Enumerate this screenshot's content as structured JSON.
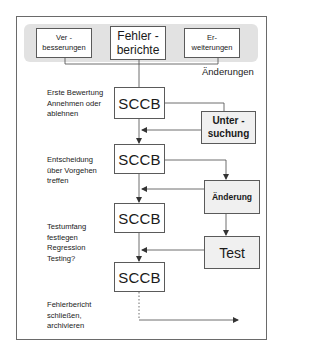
{
  "diagram": {
    "source_row": {
      "items": [
        {
          "line1": "Ver -",
          "line2": "besserungen"
        },
        {
          "line1": "Fehler -",
          "line2": "berichte"
        },
        {
          "line1": "Er-",
          "line2": "weiterungen"
        }
      ],
      "group_label": "Änderungen"
    },
    "steps": [
      {
        "node": "SCCB",
        "description": [
          "Erste Bewertung",
          "Annehmen oder",
          "ablehnen"
        ]
      },
      {
        "node": "SCCB",
        "description": [
          "Entscheidung",
          "über Vorgehen",
          "treffen"
        ]
      },
      {
        "node": "SCCB",
        "description": [
          "Testumfang",
          "festlegen",
          "Regression",
          "Testing?"
        ]
      },
      {
        "node": "SCCB",
        "description": [
          "Fehlerbericht",
          "schließen,",
          "archivieren"
        ]
      }
    ],
    "side_nodes": [
      {
        "line1": "Unter -",
        "line2": "suchung"
      },
      {
        "label": "Änderung"
      },
      {
        "label": "Test"
      }
    ],
    "colors": {
      "band": "#e2e2e2",
      "box_border": "#5a5a5a",
      "gray_box": "#f0f0f0",
      "line": "#4a4a4a"
    }
  }
}
